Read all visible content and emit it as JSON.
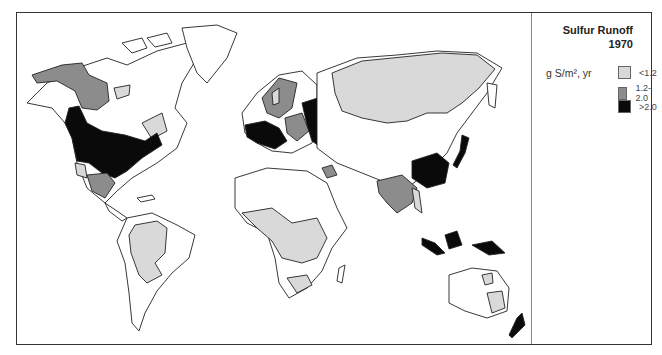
{
  "legend": {
    "title_line1": "Sulfur Runoff",
    "title_line2": "1970",
    "unit": "g S/m², yr",
    "classes": [
      {
        "label": "<1.2",
        "color": "#d9d9d9"
      },
      {
        "label": "1.2-2.0",
        "color": "#8c8c8c"
      },
      {
        "label": ">2.0",
        "color": "#0a0a0a"
      }
    ]
  },
  "map": {
    "subject": "World map of sulfur runoff",
    "high_regions": [
      "Eastern United States",
      "Western Europe",
      "Eastern Europe / Western Russia",
      "Eastern China",
      "Japan",
      "Indonesia",
      "New Guinea",
      "New Zealand"
    ],
    "medium_regions": [
      "Alaska / Northwest Canada",
      "Scandinavia",
      "Central Europe",
      "Mexico",
      "India / Southeast Asia",
      "Middle East"
    ],
    "low_regions": [
      "Siberia",
      "Central Africa",
      "South Africa",
      "South America",
      "Eastern Australia",
      "Eastern Canada"
    ]
  }
}
